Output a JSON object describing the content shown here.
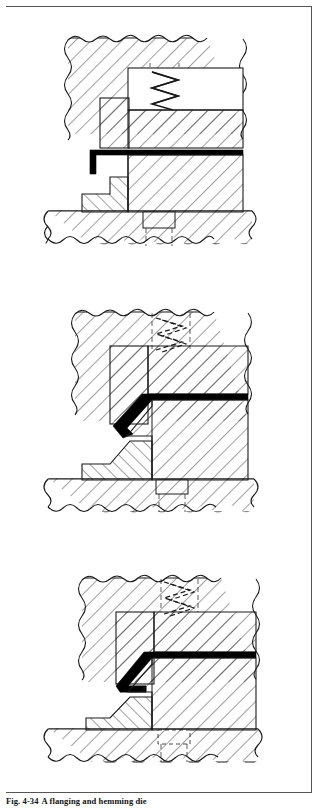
{
  "figure": {
    "caption_number": "Fig. 4-34",
    "caption_text": "A flanging and hemming die",
    "caption_full": "Fig. 4-34  A flanging and hemming die",
    "panel_count": 3
  },
  "colors": {
    "line": "#1a1a1a",
    "hatch": "#2b2b2b",
    "workpiece": "#000000",
    "background": "#ffffff",
    "frame": "#555555",
    "hidden_line": "#3a3a3a"
  },
  "panels": [
    {
      "id": "panel-1",
      "stage_label": "Stage 1 - dies open, blank loaded flat",
      "parts": [
        {
          "name": "upper-shoe",
          "hatch_dir": "right"
        },
        {
          "name": "flanging-steel",
          "hatch_dir": "right"
        },
        {
          "name": "pressure-pad",
          "hatch_dir": "none"
        },
        {
          "name": "compression-spring",
          "state": "extended",
          "style": "solid-zigzag"
        },
        {
          "name": "lower-die-block",
          "hatch_dir": "right"
        },
        {
          "name": "die-step",
          "hatch_dir": "left"
        },
        {
          "name": "die-shoe",
          "hatch_dir": "right"
        },
        {
          "name": "dowel-block",
          "hatch_dir": "none"
        },
        {
          "name": "sheet-metal-blank",
          "state": "flat"
        }
      ]
    },
    {
      "id": "panel-2",
      "stage_label": "Stage 2 - flange formed at 45 degrees",
      "parts": [
        {
          "name": "upper-shoe",
          "hatch_dir": "right"
        },
        {
          "name": "flanging-steel",
          "hatch_dir": "right"
        },
        {
          "name": "pressure-pad",
          "hatch_dir": "right"
        },
        {
          "name": "compression-spring",
          "state": "compressed",
          "style": "dashed-zigzag"
        },
        {
          "name": "lower-die-block",
          "hatch_dir": "right"
        },
        {
          "name": "die-step",
          "hatch_dir": "left"
        },
        {
          "name": "die-shoe",
          "hatch_dir": "right"
        },
        {
          "name": "dowel-block",
          "hatch_dir": "none"
        },
        {
          "name": "sheet-metal-blank",
          "state": "flanged"
        }
      ]
    },
    {
      "id": "panel-3",
      "stage_label": "Stage 3 - hem closed flat",
      "parts": [
        {
          "name": "upper-shoe",
          "hatch_dir": "right"
        },
        {
          "name": "hemming-steel",
          "hatch_dir": "right"
        },
        {
          "name": "pressure-pad",
          "hatch_dir": "right"
        },
        {
          "name": "compression-spring",
          "state": "fully-compressed",
          "style": "dashed-zigzag"
        },
        {
          "name": "lower-die-block",
          "hatch_dir": "right"
        },
        {
          "name": "die-step",
          "hatch_dir": "left"
        },
        {
          "name": "die-shoe",
          "hatch_dir": "right"
        },
        {
          "name": "dowel-block",
          "hatch_dir": "none"
        },
        {
          "name": "sheet-metal-blank",
          "state": "hemmed"
        }
      ]
    }
  ]
}
